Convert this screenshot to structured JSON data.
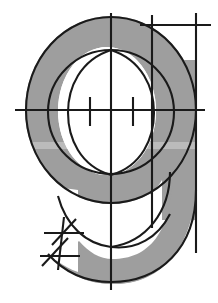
{
  "figure": {
    "subject_glyph": "g",
    "width": 218,
    "height": 303,
    "background_color": "#ffffff",
    "glyph_fill_color": "#9e9e9e",
    "construction_line_color": "#1a1a1a",
    "counter_color": "#ffffff",
    "band_tint_color": "#f4f4f2"
  },
  "glyph": {
    "name": "g-glyph-shape",
    "bowl": {
      "center_x": 111,
      "center_y": 110,
      "outer_radius_x": 86,
      "outer_radius_y": 94,
      "inner_radius_x": 49,
      "inner_radius_y": 64
    },
    "stem": {
      "x_left": 172,
      "x_right": 197,
      "y_top": 22,
      "y_bottom": 232
    },
    "tail": {
      "sweep_from_x": 197,
      "sweep_to_x": 70,
      "bottom_y": 283
    }
  },
  "construction": {
    "vertical_center_axis": {
      "name": "vertical-center-axis",
      "x": 111,
      "y_top": 13,
      "y_bottom": 290
    },
    "horizontal_center_axis": {
      "name": "horizontal-center-axis",
      "y": 110,
      "x_left": 15,
      "x_right": 205
    },
    "upper_horizontal_rule": {
      "name": "upper-horizontal-rule",
      "y": 25,
      "x_left": 140,
      "x_right": 211
    },
    "stem_guide_left": {
      "name": "stem-guide-left-vertical",
      "x": 152,
      "y_top": 15,
      "y_bottom": 228
    },
    "stem_guide_right": {
      "name": "stem-guide-right-vertical",
      "x": 196,
      "y_top": 13,
      "y_bottom": 253
    },
    "outer_circle": {
      "name": "outer-construction-circle",
      "cx": 111,
      "cy": 110,
      "rx": 85,
      "ry": 93
    },
    "inner_circle": {
      "name": "inner-construction-circle",
      "cx": 111,
      "cy": 112,
      "rx": 63,
      "ry": 62
    },
    "vesica_arcs": {
      "name": "vesica-construction-arcs",
      "top_crossing_x": 111,
      "top_crossing_y": 50,
      "bottom_crossing_x": 111,
      "bottom_crossing_y": 175,
      "half_width": 43
    },
    "center_tick_left": {
      "name": "center-tick-left",
      "x": 90,
      "y_top": 97,
      "y_bottom": 126
    },
    "center_tick_right": {
      "name": "center-tick-right",
      "x": 133,
      "y_top": 97,
      "y_bottom": 126
    },
    "tail_arcs": {
      "name": "tail-construction-arcs",
      "crossing_x": 111,
      "crossing_y": 247
    }
  },
  "hatch_cluster": {
    "name": "hatch-mark-cluster",
    "location": "bottom-left",
    "anchor_x": 60,
    "anchor_y": 242,
    "marks": [
      {
        "name": "hatch-horizontal-upper",
        "x1": 44,
        "y1": 233,
        "x2": 84,
        "y2": 233
      },
      {
        "name": "hatch-horizontal-lower",
        "x1": 40,
        "y1": 256,
        "x2": 80,
        "y2": 256
      },
      {
        "name": "hatch-steep-vertical",
        "x1": 64,
        "y1": 217,
        "x2": 58,
        "y2": 270
      },
      {
        "name": "hatch-diagonal-upper",
        "x1": 52,
        "y1": 245,
        "x2": 76,
        "y2": 219
      },
      {
        "name": "hatch-diagonal-lower",
        "x1": 42,
        "y1": 266,
        "x2": 68,
        "y2": 238
      }
    ]
  },
  "scan_band": {
    "name": "scan-artifact-band",
    "y_top": 142,
    "height": 7
  }
}
